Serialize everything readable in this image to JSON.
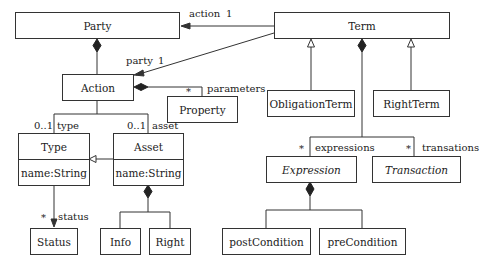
{
  "diagram": {
    "type": "uml-class-diagram",
    "classes": [
      {
        "id": "party",
        "name": "Party"
      },
      {
        "id": "term",
        "name": "Term"
      },
      {
        "id": "action",
        "name": "Action"
      },
      {
        "id": "property",
        "name": "Property"
      },
      {
        "id": "obligationterm",
        "name": "ObligationTerm"
      },
      {
        "id": "rightterm",
        "name": "RightTerm"
      },
      {
        "id": "type",
        "name": "Type",
        "attribute": "name:String"
      },
      {
        "id": "asset",
        "name": "Asset",
        "attribute": "name:String"
      },
      {
        "id": "expression",
        "name": "Expression",
        "abstract": true
      },
      {
        "id": "transaction",
        "name": "Transaction",
        "abstract": true
      },
      {
        "id": "status",
        "name": "Status"
      },
      {
        "id": "info",
        "name": "Info"
      },
      {
        "id": "right",
        "name": "Right"
      },
      {
        "id": "postcondition",
        "name": "postCondition"
      },
      {
        "id": "precondition",
        "name": "preCondition"
      }
    ],
    "labels": {
      "action_role": "action",
      "action_mult": "1",
      "party_role": "party",
      "party_mult": "1",
      "parameters_role": "parameters",
      "parameters_mult": "*",
      "type_mult": "0..1",
      "type_role": "type",
      "asset_mult": "0..1",
      "asset_role": "asset",
      "status_mult": "*",
      "status_role": "status",
      "expressions_mult": "*",
      "expressions_role": "expressions",
      "transations_mult": "*",
      "transations_role": "transations"
    },
    "relations": [
      {
        "from": "Term",
        "to": "Party",
        "kind": "association",
        "role": "action",
        "multiplicity": "1"
      },
      {
        "from": "Term",
        "to": "Action",
        "kind": "association",
        "role": "party",
        "multiplicity": "1"
      },
      {
        "whole": "Party",
        "part": "Action",
        "kind": "composition"
      },
      {
        "whole": "Action",
        "part": "Property",
        "kind": "composition",
        "role": "parameters",
        "multiplicity": "*"
      },
      {
        "from": "Action",
        "to": "Type",
        "kind": "association",
        "role": "type",
        "multiplicity": "0..1"
      },
      {
        "from": "Action",
        "to": "Asset",
        "kind": "association",
        "role": "asset",
        "multiplicity": "0..1"
      },
      {
        "child": "Asset",
        "parent": "Type",
        "kind": "generalization"
      },
      {
        "from": "Type",
        "to": "Status",
        "kind": "association",
        "role": "status",
        "multiplicity": "*"
      },
      {
        "whole": "Asset",
        "part": "Info",
        "kind": "composition"
      },
      {
        "whole": "Asset",
        "part": "Right",
        "kind": "composition"
      },
      {
        "child": "ObligationTerm",
        "parent": "Term",
        "kind": "generalization"
      },
      {
        "child": "RightTerm",
        "parent": "Term",
        "kind": "generalization"
      },
      {
        "whole": "Term",
        "part": "Expression",
        "kind": "composition",
        "role": "expressions",
        "multiplicity": "*"
      },
      {
        "whole": "Term",
        "part": "Transaction",
        "kind": "composition",
        "role": "transations",
        "multiplicity": "*"
      },
      {
        "whole": "Expression",
        "part": "postCondition",
        "kind": "composition"
      },
      {
        "whole": "Expression",
        "part": "preCondition",
        "kind": "composition"
      }
    ]
  }
}
